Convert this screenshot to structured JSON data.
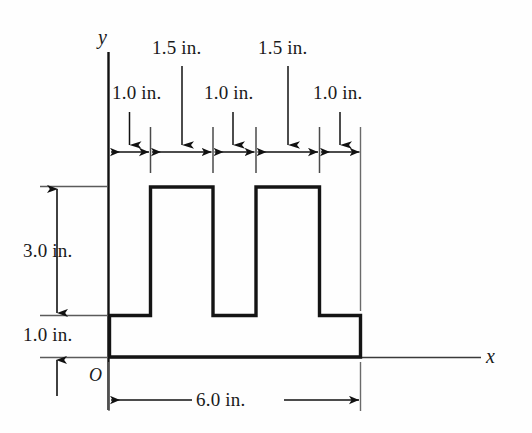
{
  "figure": {
    "kind": "engineering-cross-section-diagram",
    "background_color": "#fefefe",
    "line_color": "#111111",
    "thin_line_color": "#5a5a5a",
    "axes": {
      "y_axis_label": "y",
      "x_axis_label": "x",
      "origin_label": "O"
    },
    "top_dimensions": {
      "upper_row": [
        {
          "value": "1.5 in.",
          "target_x_in": 1.5
        },
        {
          "value": "1.5 in.",
          "target_x_in": 4.0
        }
      ],
      "lower_row": [
        {
          "value": "1.0 in.",
          "target_x_in": 0.5
        },
        {
          "value": "1.0 in.",
          "target_x_in": 2.5
        },
        {
          "value": "1.0 in.",
          "target_x_in": 5.5
        }
      ],
      "segments_in": [
        1.0,
        1.5,
        1.0,
        1.5,
        1.0
      ]
    },
    "left_dimensions": [
      {
        "value": "3.0 in."
      },
      {
        "value": "1.0 in."
      }
    ],
    "bottom_dimension": {
      "value": "6.0 in."
    },
    "shape": {
      "description": "double-tee / castellated flanged section outline",
      "total_width_in": 6.0,
      "base_height_in": 1.0,
      "web_height_in": 3.0,
      "total_height_in": 4.0,
      "tab_width_in": 1.0,
      "gap_width_in": 1.5,
      "tab_count": 2
    }
  }
}
